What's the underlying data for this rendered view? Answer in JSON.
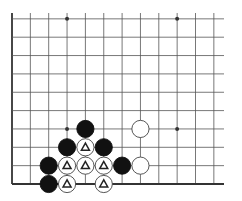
{
  "diagram": {
    "type": "go-board-fragment",
    "board_size": 19,
    "visible_region": {
      "cols": [
        1,
        12
      ],
      "rows": [
        1,
        10
      ],
      "corner": "bottom-left"
    },
    "colors": {
      "background": "#ffffff",
      "line": "#555555",
      "edge": "#333333",
      "black": "#111111",
      "white": "#ffffff",
      "marker": "#222222"
    },
    "star_points": [
      {
        "col": 4,
        "row": 4
      },
      {
        "col": 10,
        "row": 4
      },
      {
        "col": 4,
        "row": 10
      },
      {
        "col": 10,
        "row": 10
      }
    ],
    "stones": [
      {
        "color": "black",
        "col": 5,
        "row": 4
      },
      {
        "color": "white",
        "col": 8,
        "row": 4
      },
      {
        "color": "black",
        "col": 4,
        "row": 3
      },
      {
        "color": "white",
        "col": 5,
        "row": 3,
        "marker": "triangle"
      },
      {
        "color": "black",
        "col": 6,
        "row": 3
      },
      {
        "color": "black",
        "col": 3,
        "row": 2
      },
      {
        "color": "white",
        "col": 4,
        "row": 2,
        "marker": "triangle"
      },
      {
        "color": "white",
        "col": 5,
        "row": 2,
        "marker": "triangle"
      },
      {
        "color": "white",
        "col": 6,
        "row": 2,
        "marker": "triangle"
      },
      {
        "color": "black",
        "col": 7,
        "row": 2
      },
      {
        "color": "white",
        "col": 8,
        "row": 2
      },
      {
        "color": "black",
        "col": 3,
        "row": 1
      },
      {
        "color": "white",
        "col": 4,
        "row": 1,
        "marker": "triangle"
      },
      {
        "color": "white",
        "col": 6,
        "row": 1,
        "marker": "triangle"
      }
    ]
  }
}
